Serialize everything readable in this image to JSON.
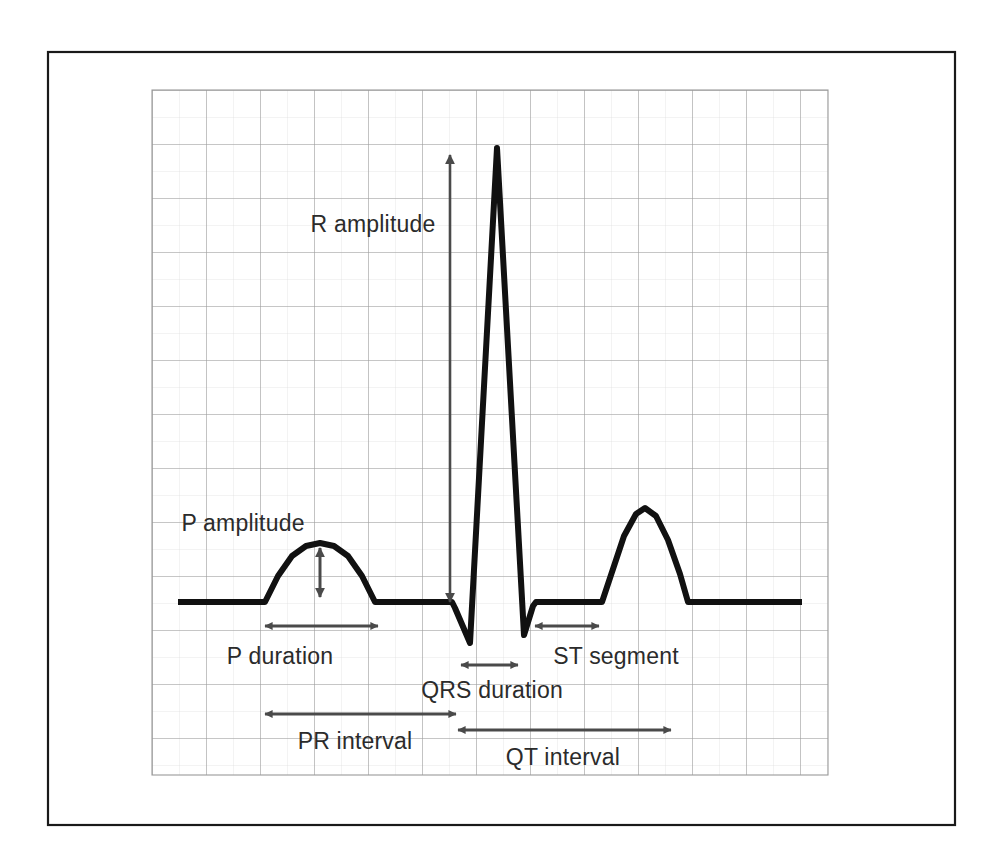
{
  "figure": {
    "kind": "ecg-waveform-diagram",
    "background_color": "#ffffff",
    "outer_border_color": "#1a1a1a",
    "grid_major_color": "#9a9a9a",
    "grid_minor_color": "#d4d4d4",
    "trace_color": "#111111",
    "arrow_color": "#4a4a4a",
    "label_color": "#2b2b2b"
  },
  "labels": [
    {
      "id": "r-amplitude",
      "text": "R amplitude",
      "x": 373,
      "y": 232,
      "anchor": "middle"
    },
    {
      "id": "p-amplitude",
      "text": "P amplitude",
      "x": 243,
      "y": 531,
      "anchor": "middle"
    },
    {
      "id": "p-duration",
      "text": "P duration",
      "x": 280,
      "y": 664,
      "anchor": "middle"
    },
    {
      "id": "st-segment",
      "text": "ST segment",
      "x": 616,
      "y": 664,
      "anchor": "middle"
    },
    {
      "id": "qrs-duration",
      "text": "QRS duration",
      "x": 492,
      "y": 698,
      "anchor": "middle"
    },
    {
      "id": "pr-interval",
      "text": "PR interval",
      "x": 355,
      "y": 749,
      "anchor": "middle"
    },
    {
      "id": "qt-interval",
      "text": "QT interval",
      "x": 563,
      "y": 765,
      "anchor": "middle"
    }
  ],
  "chart_data": {
    "type": "line",
    "xlabel": "",
    "ylabel": "",
    "grid": true,
    "legend": "none",
    "baseline_y": 602,
    "grid_cell_px": 54,
    "grid_bounds": {
      "x0": 152,
      "y0": 90,
      "x1": 828,
      "y1": 775
    },
    "trace_points": [
      [
        178,
        602
      ],
      [
        265,
        602
      ],
      [
        278,
        576
      ],
      [
        292,
        556
      ],
      [
        306,
        546
      ],
      [
        320,
        543
      ],
      [
        334,
        546
      ],
      [
        348,
        556
      ],
      [
        362,
        576
      ],
      [
        375,
        602
      ],
      [
        378,
        602
      ],
      [
        452,
        602
      ],
      [
        455,
        608
      ],
      [
        470,
        643
      ],
      [
        497,
        148
      ],
      [
        524,
        635
      ],
      [
        533,
        606
      ],
      [
        536,
        602
      ],
      [
        602,
        602
      ],
      [
        612,
        572
      ],
      [
        624,
        536
      ],
      [
        636,
        514
      ],
      [
        645,
        508
      ],
      [
        656,
        516
      ],
      [
        668,
        540
      ],
      [
        680,
        574
      ],
      [
        688,
        602
      ],
      [
        802,
        602
      ]
    ],
    "features": [
      {
        "name": "P wave",
        "onset_x": 265,
        "peak_x": 320,
        "peak_y": 543,
        "offset_x": 378
      },
      {
        "name": "Q deflection",
        "x": 470,
        "trough_y": 643
      },
      {
        "name": "R wave",
        "x": 497,
        "peak_y": 148
      },
      {
        "name": "S deflection",
        "x": 525,
        "trough_y": 635
      },
      {
        "name": "T wave",
        "onset_x": 602,
        "peak_x": 645,
        "peak_y": 508,
        "offset_x": 688
      }
    ],
    "annotations": [
      {
        "id": "r-amplitude-arrow",
        "label": "R amplitude",
        "orientation": "vertical",
        "heads": "both",
        "x": 450,
        "y1": 155,
        "y2": 602
      },
      {
        "id": "p-amplitude-arrow",
        "label": "P amplitude",
        "orientation": "vertical",
        "heads": "both",
        "x": 320,
        "y1": 548,
        "y2": 597
      },
      {
        "id": "p-duration-arrow",
        "label": "P duration",
        "orientation": "horizontal",
        "heads": "both",
        "y": 626,
        "x1": 265,
        "x2": 378
      },
      {
        "id": "qrs-duration-arrow",
        "label": "QRS duration",
        "orientation": "horizontal",
        "heads": "both",
        "y": 665,
        "x1": 461,
        "x2": 518
      },
      {
        "id": "st-segment-arrow",
        "label": "ST segment",
        "orientation": "horizontal",
        "heads": "both",
        "y": 626,
        "x1": 535,
        "x2": 599
      },
      {
        "id": "pr-interval-arrow",
        "label": "PR interval",
        "orientation": "horizontal",
        "heads": "both",
        "y": 714,
        "x1": 265,
        "x2": 456
      },
      {
        "id": "qt-interval-arrow",
        "label": "QT interval",
        "orientation": "horizontal",
        "heads": "both",
        "y": 730,
        "x1": 458,
        "x2": 671
      }
    ]
  }
}
